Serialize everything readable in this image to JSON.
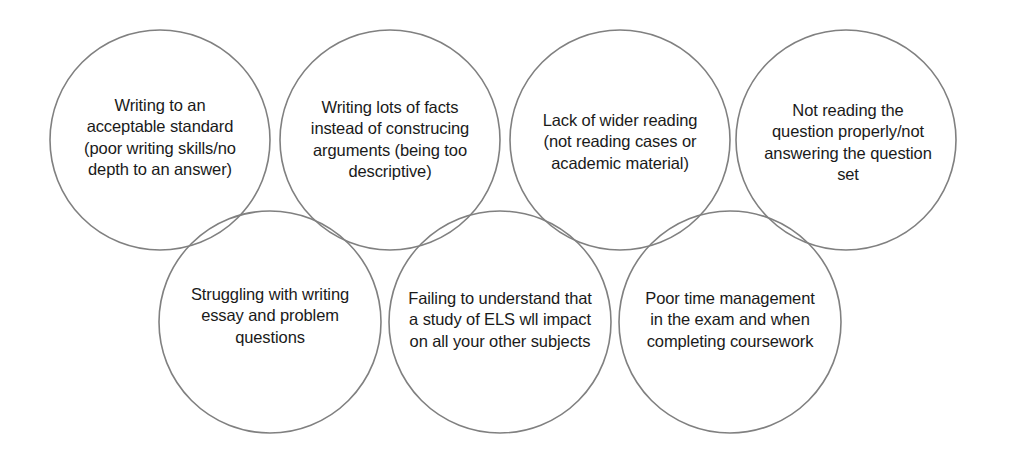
{
  "diagram": {
    "type": "overlapping-circles",
    "title": "",
    "canvas": {
      "width": 1014,
      "height": 455
    },
    "style": {
      "background_color": "#ffffff",
      "circle_stroke_color": "#808080",
      "circle_fill": "none",
      "text_color": "#1a1a1a"
    },
    "circles": [
      {
        "id": "circle-1",
        "row": "top",
        "cx": 160,
        "cy": 140,
        "r": 110,
        "label_cx": 160,
        "label_cy": 138,
        "text": "Writing to an acceptable standard (poor writing skills/no depth to an answer)"
      },
      {
        "id": "circle-2",
        "row": "top",
        "cx": 390,
        "cy": 140,
        "r": 110,
        "label_cx": 390,
        "label_cy": 140,
        "text": "Writing lots of facts instead of construcing arguments (being too descriptive)"
      },
      {
        "id": "circle-3",
        "row": "top",
        "cx": 620,
        "cy": 140,
        "r": 110,
        "label_cx": 620,
        "label_cy": 142,
        "text": "Lack of wider reading (not reading cases or academic material)"
      },
      {
        "id": "circle-4",
        "row": "top",
        "cx": 846,
        "cy": 140,
        "r": 110,
        "label_cx": 848,
        "label_cy": 143,
        "text": "Not reading the question properly/not answering the question set"
      },
      {
        "id": "circle-5",
        "row": "bottom",
        "cx": 270,
        "cy": 322,
        "r": 111,
        "label_cx": 270,
        "label_cy": 316,
        "text": "Struggling with writing essay and problem questions"
      },
      {
        "id": "circle-6",
        "row": "bottom",
        "cx": 500,
        "cy": 322,
        "r": 111,
        "label_cx": 500,
        "label_cy": 320,
        "text": "Failing to understand that a study of ELS wll impact on all your other subjects"
      },
      {
        "id": "circle-7",
        "row": "bottom",
        "cx": 730,
        "cy": 322,
        "r": 111,
        "label_cx": 730,
        "label_cy": 320,
        "text": "Poor time management in the exam and when completing coursework"
      }
    ]
  }
}
